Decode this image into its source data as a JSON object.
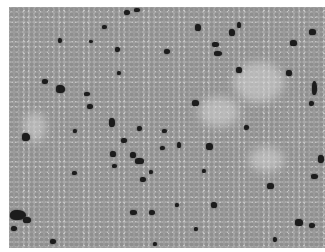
{
  "image": {
    "description": "Grayscale histology micrograph of densely packed cells with scattered darkly stained nuclei",
    "colors": {
      "background": "#a9a9a9",
      "stained_cell": "#1c1c1c",
      "border": "#ffffff"
    },
    "pale_regions": [
      {
        "x": 225,
        "y": 55,
        "w": 50,
        "h": 40
      },
      {
        "x": 190,
        "y": 90,
        "w": 40,
        "h": 30
      },
      {
        "x": 15,
        "y": 105,
        "w": 22,
        "h": 30
      },
      {
        "x": 240,
        "y": 140,
        "w": 35,
        "h": 25
      }
    ],
    "stained_cells": [
      {
        "x": 115,
        "y": 3,
        "w": 6,
        "h": 5
      },
      {
        "x": 125,
        "y": 1,
        "w": 6,
        "h": 4
      },
      {
        "x": 93,
        "y": 18,
        "w": 5,
        "h": 4
      },
      {
        "x": 186,
        "y": 17,
        "w": 6,
        "h": 7
      },
      {
        "x": 220,
        "y": 22,
        "w": 6,
        "h": 7
      },
      {
        "x": 228,
        "y": 15,
        "w": 4,
        "h": 6
      },
      {
        "x": 300,
        "y": 22,
        "w": 7,
        "h": 6
      },
      {
        "x": 49,
        "y": 31,
        "w": 4,
        "h": 5
      },
      {
        "x": 80,
        "y": 33,
        "w": 4,
        "h": 3
      },
      {
        "x": 155,
        "y": 42,
        "w": 6,
        "h": 5
      },
      {
        "x": 203,
        "y": 35,
        "w": 7,
        "h": 5
      },
      {
        "x": 205,
        "y": 44,
        "w": 8,
        "h": 5
      },
      {
        "x": 281,
        "y": 33,
        "w": 7,
        "h": 6
      },
      {
        "x": 106,
        "y": 40,
        "w": 5,
        "h": 5
      },
      {
        "x": 227,
        "y": 60,
        "w": 6,
        "h": 6
      },
      {
        "x": 277,
        "y": 63,
        "w": 6,
        "h": 6
      },
      {
        "x": 108,
        "y": 64,
        "w": 4,
        "h": 4
      },
      {
        "x": 33,
        "y": 72,
        "w": 6,
        "h": 5
      },
      {
        "x": 47,
        "y": 78,
        "w": 9,
        "h": 8
      },
      {
        "x": 75,
        "y": 85,
        "w": 6,
        "h": 4
      },
      {
        "x": 303,
        "y": 74,
        "w": 5,
        "h": 14
      },
      {
        "x": 300,
        "y": 94,
        "w": 5,
        "h": 5
      },
      {
        "x": 78,
        "y": 97,
        "w": 6,
        "h": 5
      },
      {
        "x": 183,
        "y": 93,
        "w": 7,
        "h": 6
      },
      {
        "x": 100,
        "y": 111,
        "w": 6,
        "h": 9
      },
      {
        "x": 128,
        "y": 119,
        "w": 5,
        "h": 5
      },
      {
        "x": 13,
        "y": 126,
        "w": 8,
        "h": 8
      },
      {
        "x": 153,
        "y": 122,
        "w": 5,
        "h": 4
      },
      {
        "x": 112,
        "y": 131,
        "w": 6,
        "h": 5
      },
      {
        "x": 168,
        "y": 135,
        "w": 4,
        "h": 6
      },
      {
        "x": 197,
        "y": 136,
        "w": 7,
        "h": 7
      },
      {
        "x": 151,
        "y": 139,
        "w": 5,
        "h": 4
      },
      {
        "x": 101,
        "y": 144,
        "w": 6,
        "h": 6
      },
      {
        "x": 121,
        "y": 145,
        "w": 6,
        "h": 6
      },
      {
        "x": 126,
        "y": 151,
        "w": 9,
        "h": 6
      },
      {
        "x": 103,
        "y": 157,
        "w": 5,
        "h": 4
      },
      {
        "x": 309,
        "y": 148,
        "w": 6,
        "h": 8
      },
      {
        "x": 63,
        "y": 164,
        "w": 5,
        "h": 4
      },
      {
        "x": 140,
        "y": 163,
        "w": 4,
        "h": 4
      },
      {
        "x": 193,
        "y": 162,
        "w": 4,
        "h": 4
      },
      {
        "x": 131,
        "y": 170,
        "w": 6,
        "h": 5
      },
      {
        "x": 302,
        "y": 167,
        "w": 7,
        "h": 5
      },
      {
        "x": 258,
        "y": 176,
        "w": 7,
        "h": 6
      },
      {
        "x": 202,
        "y": 195,
        "w": 6,
        "h": 6
      },
      {
        "x": 166,
        "y": 196,
        "w": 4,
        "h": 4
      },
      {
        "x": 1,
        "y": 203,
        "w": 16,
        "h": 10
      },
      {
        "x": 14,
        "y": 210,
        "w": 8,
        "h": 6
      },
      {
        "x": 121,
        "y": 203,
        "w": 7,
        "h": 5
      },
      {
        "x": 140,
        "y": 203,
        "w": 6,
        "h": 5
      },
      {
        "x": 2,
        "y": 219,
        "w": 6,
        "h": 5
      },
      {
        "x": 286,
        "y": 212,
        "w": 8,
        "h": 7
      },
      {
        "x": 300,
        "y": 216,
        "w": 6,
        "h": 5
      },
      {
        "x": 185,
        "y": 220,
        "w": 4,
        "h": 4
      },
      {
        "x": 41,
        "y": 232,
        "w": 6,
        "h": 5
      },
      {
        "x": 264,
        "y": 230,
        "w": 4,
        "h": 5
      },
      {
        "x": 144,
        "y": 235,
        "w": 4,
        "h": 4
      },
      {
        "x": 235,
        "y": 118,
        "w": 5,
        "h": 5
      },
      {
        "x": 64,
        "y": 122,
        "w": 4,
        "h": 4
      }
    ]
  }
}
